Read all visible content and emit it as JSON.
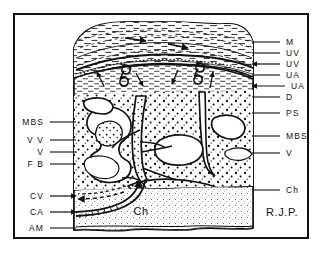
{
  "figure": {
    "signature": "R.J.P.",
    "frame_color": "#111111",
    "background": "#ffffff"
  },
  "labels_left": [
    {
      "key": "mbs",
      "text": "MBS",
      "x": 44,
      "y": 122,
      "leader_to_x": 76,
      "arrow": "none"
    },
    {
      "key": "vv",
      "text": "V V",
      "x": 44,
      "y": 140,
      "leader_to_x": 76,
      "arrow": "none"
    },
    {
      "key": "v",
      "text": "V",
      "x": 44,
      "y": 152,
      "leader_to_x": 76,
      "arrow": "none"
    },
    {
      "key": "fb",
      "text": "F B",
      "x": 44,
      "y": 164,
      "leader_to_x": 76,
      "arrow": "none"
    },
    {
      "key": "cv",
      "text": "CV",
      "x": 44,
      "y": 196,
      "leader_to_x": 76,
      "arrow": "left"
    },
    {
      "key": "ca",
      "text": "CA",
      "x": 44,
      "y": 212,
      "leader_to_x": 76,
      "arrow": "right"
    },
    {
      "key": "am",
      "text": "AM",
      "x": 44,
      "y": 228,
      "leader_to_x": 76,
      "arrow": "none"
    }
  ],
  "labels_right": [
    {
      "key": "m",
      "text": "M",
      "x": 286,
      "y": 42,
      "leader_to_x": 252,
      "arrow": "none"
    },
    {
      "key": "uv1",
      "text": "UV",
      "x": 286,
      "y": 53,
      "leader_to_x": 252,
      "arrow": "none"
    },
    {
      "key": "uv2",
      "text": "UV",
      "x": 286,
      "y": 64,
      "leader_to_x": 252,
      "arrow": "right"
    },
    {
      "key": "ua1",
      "text": "UA",
      "x": 286,
      "y": 75,
      "leader_to_x": 252,
      "arrow": "none"
    },
    {
      "key": "ua2",
      "text": "UA",
      "x": 291,
      "y": 86,
      "leader_to_x": 252,
      "arrow": "left"
    },
    {
      "key": "d",
      "text": "D",
      "x": 286,
      "y": 97,
      "leader_to_x": 252,
      "arrow": "none"
    },
    {
      "key": "ps",
      "text": "PS",
      "x": 286,
      "y": 113,
      "leader_to_x": 252,
      "arrow": "none"
    },
    {
      "key": "mbs2",
      "text": "MBS",
      "x": 286,
      "y": 136,
      "leader_to_x": 252,
      "arrow": "none"
    },
    {
      "key": "v2",
      "text": "V",
      "x": 286,
      "y": 153,
      "leader_to_x": 252,
      "arrow": "none"
    },
    {
      "key": "ch",
      "text": "Ch",
      "x": 286,
      "y": 190,
      "leader_to_x": 252,
      "arrow": "none"
    }
  ],
  "labels_inner": [
    {
      "key": "ch-inner",
      "text": "Ch",
      "x": 141,
      "y": 211
    }
  ],
  "signature_pos": {
    "x": 282,
    "y": 212
  },
  "legend_keys": {
    "M": "Myometrium",
    "UV": "Uterine vein",
    "UA": "Uterine artery",
    "D": "Decidua",
    "PS": "Placental septum",
    "MBS": "Maternal blood space (intervillous space)",
    "V": "Villus",
    "VV": "Villous vessel",
    "FB": "Fibrin / fibrinoid",
    "CV": "Chorionic vein",
    "CA": "Chorionic artery",
    "AM": "Amnion",
    "Ch": "Chorion / chorionic plate"
  }
}
